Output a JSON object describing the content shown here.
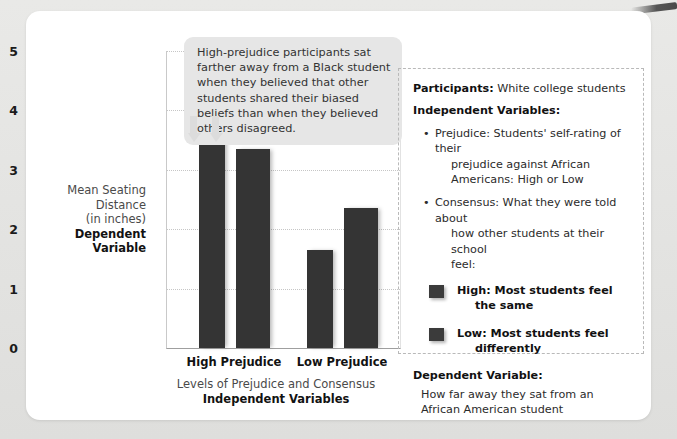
{
  "chart_data": {
    "type": "bar",
    "title": "",
    "xlabel": "Levels of Prejudice and Consensus",
    "xlabel_strong": "Independent Variables",
    "ylabel": "Mean Seating Distance\n(in inches)",
    "ylabel_line1": "Mean Seating",
    "ylabel_line2": "Distance",
    "ylabel_line3": "(in inches)",
    "ylabel_strong": "Dependent Variable",
    "categories": [
      "High Prejudice",
      "Low Prejudice"
    ],
    "ylim": [
      0,
      5
    ],
    "yticks": [
      "5",
      "4",
      "3",
      "2",
      "1",
      "0"
    ],
    "grid": true,
    "legend_position": "right-panel",
    "series": [
      {
        "name": "High: Most students feel the same",
        "values": [
          4.25,
          1.65
        ]
      },
      {
        "name": "Low: Most students feel differently",
        "values": [
          3.35,
          2.35
        ]
      }
    ],
    "bar_color": "#343434"
  },
  "callout": {
    "text": "High-prejudice participants sat farther away from a Black student when they believed that other students shared their biased beliefs than when they believed others disagreed."
  },
  "info_panel": {
    "participants_label": "Participants:",
    "participants_value": "White college students",
    "iv_heading": "Independent Variables:",
    "bullets": [
      {
        "line1": "Prejudice: Students' self-rating of their",
        "line2": "prejudice against African",
        "line3": "Americans: High or Low"
      },
      {
        "line1": "Consensus: What they were told about",
        "line2": "how other students at their school",
        "line3": "feel:"
      }
    ],
    "legend": [
      {
        "line1": "High: Most students feel",
        "line2": "the same",
        "color": "#3b3b3b"
      },
      {
        "line1": "Low: Most students feel",
        "line2": "differently",
        "color": "#3b3b3b"
      }
    ],
    "dv_heading": "Dependent Variable:",
    "dv_line1": "How far away they sat from an African",
    "dv_line2": "American student"
  }
}
